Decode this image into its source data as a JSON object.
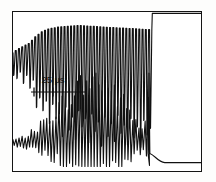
{
  "figure": {
    "title": "",
    "background_color": "#fdfdfc",
    "frame_color": "#141414",
    "trace_color": "#111111"
  },
  "scalebar": {
    "label": "25 µs",
    "value": 25,
    "unit": "µs",
    "ticks": 3
  },
  "chart_data": {
    "type": "line",
    "title": "",
    "subtitle": "",
    "xlabel": "",
    "ylabel": "",
    "grid": false,
    "legend_position": "none",
    "annotations": [
      {
        "text": "25 µs",
        "type": "scale-bar",
        "x_span_us": 25
      }
    ],
    "axis": {
      "x_unit": "µs",
      "x_range_us": [
        0,
        250
      ],
      "y_unit": "arb. units",
      "ylim": [
        0,
        1
      ]
    },
    "series": [
      {
        "name": "upper-trace",
        "description": "Modulated signal with deep downward spikes rising to a flat saturated top at the right",
        "envelope_top": [
          {
            "x": 0,
            "y": 0.74
          },
          {
            "x": 6,
            "y": 0.76
          },
          {
            "x": 14,
            "y": 0.78
          },
          {
            "x": 22,
            "y": 0.8
          },
          {
            "x": 30,
            "y": 0.84
          },
          {
            "x": 38,
            "y": 0.87
          },
          {
            "x": 48,
            "y": 0.89
          },
          {
            "x": 60,
            "y": 0.9
          },
          {
            "x": 72,
            "y": 0.905
          },
          {
            "x": 88,
            "y": 0.91
          },
          {
            "x": 105,
            "y": 0.905
          },
          {
            "x": 120,
            "y": 0.9
          },
          {
            "x": 140,
            "y": 0.895
          },
          {
            "x": 160,
            "y": 0.89
          },
          {
            "x": 176,
            "y": 0.885
          },
          {
            "x": 184,
            "y": 0.885
          },
          {
            "x": 185,
            "y": 0.985
          },
          {
            "x": 250,
            "y": 0.985
          }
        ],
        "spike_depths": [
          0.6,
          0.58,
          0.62,
          0.55,
          0.6,
          0.52,
          0.57,
          0.4,
          0.46,
          0.38,
          0.44,
          0.3,
          0.42,
          0.33,
          0.36,
          0.22,
          0.4,
          0.26,
          0.34,
          0.2,
          0.38,
          0.28,
          0.33,
          0.18,
          0.36,
          0.25,
          0.31,
          0.16,
          0.34,
          0.22,
          0.3,
          0.19,
          0.35,
          0.24,
          0.29,
          0.17,
          0.33,
          0.21,
          0.28,
          0.15,
          0.32,
          0.23,
          0.27
        ]
      },
      {
        "name": "lower-trace",
        "description": "Oscillation growing from small ripple, peaking near centre-right, decaying through a tall narrow spike to a flat baseline",
        "envelope": [
          {
            "x": 0,
            "y": 0.2
          },
          {
            "x": 10,
            "y": 0.21
          },
          {
            "x": 20,
            "y": 0.23
          },
          {
            "x": 32,
            "y": 0.27
          },
          {
            "x": 46,
            "y": 0.33
          },
          {
            "x": 60,
            "y": 0.4
          },
          {
            "x": 75,
            "y": 0.47
          },
          {
            "x": 90,
            "y": 0.53
          },
          {
            "x": 104,
            "y": 0.57
          },
          {
            "x": 118,
            "y": 0.56
          },
          {
            "x": 132,
            "y": 0.5
          },
          {
            "x": 146,
            "y": 0.42
          },
          {
            "x": 160,
            "y": 0.33
          },
          {
            "x": 172,
            "y": 0.24
          },
          {
            "x": 180,
            "y": 0.6
          },
          {
            "x": 184,
            "y": 0.2
          },
          {
            "x": 196,
            "y": 0.07
          },
          {
            "x": 250,
            "y": 0.06
          }
        ]
      }
    ]
  }
}
